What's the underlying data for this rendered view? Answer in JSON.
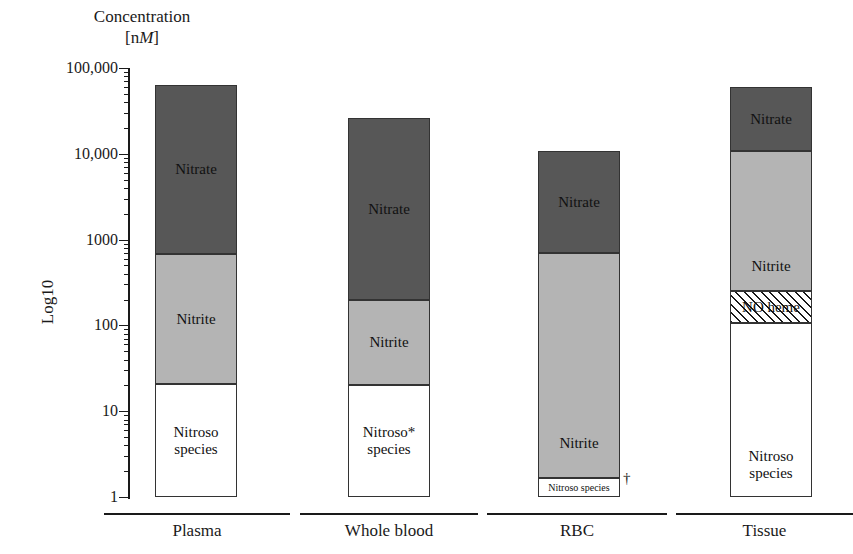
{
  "title": {
    "line1": "Concentration",
    "line2_prefix": "[n",
    "line2_italic": "M",
    "line2_suffix": "]"
  },
  "axis": {
    "y_label": "Log10",
    "y_ticks": [
      "100,000",
      "10,000",
      "1000",
      "100",
      "10",
      "1"
    ]
  },
  "colors": {
    "nitrate": "#575757",
    "nitrite": "#b4b4b4",
    "nitroso": "#ffffff",
    "no_heme": "#ffffff",
    "axis": "#1a1a1a"
  },
  "markers": {
    "rbc_dagger": "†"
  },
  "labels": {
    "nitrate": "Nitrate",
    "nitrite": "Nitrite",
    "nitroso_line1": "Nitroso",
    "nitroso_star_line1": "Nitroso*",
    "nitroso_line2": "species",
    "nitroso_inline": "Nitroso species",
    "no_heme": "NO heme"
  },
  "chart_data": {
    "type": "bar",
    "title": "Concentration [nM]",
    "xlabel": "",
    "ylabel": "Log10",
    "yscale": "log10",
    "ylim": [
      1,
      100000
    ],
    "ytick_values": [
      1,
      10,
      100,
      1000,
      10000,
      100000
    ],
    "ytick_labels": [
      "1",
      "10",
      "100",
      "1000",
      "10,000",
      "100,000"
    ],
    "grid": false,
    "legend": "in-bar labels",
    "stacked": true,
    "categories": [
      "Plasma",
      "Whole blood",
      "RBC",
      "Tissue"
    ],
    "series": [
      {
        "name": "Nitrate",
        "fill": "dark-gray",
        "top_values": [
          63000,
          23000,
          10500,
          60000
        ],
        "bottom_values": [
          650,
          190,
          660,
          10000
        ]
      },
      {
        "name": "Nitrite",
        "fill": "medium-gray",
        "top_values": [
          650,
          190,
          660,
          10000
        ],
        "bottom_values": [
          20,
          20,
          1.3,
          270
        ]
      },
      {
        "name": "NO heme",
        "fill": "hatched",
        "top_values": [
          null,
          null,
          null,
          270
        ],
        "bottom_values": [
          null,
          null,
          null,
          140
        ]
      },
      {
        "name": "Nitroso species",
        "fill": "white",
        "top_values": [
          20,
          20,
          1.3,
          140
        ],
        "bottom_values": [
          1,
          1,
          1,
          1
        ]
      }
    ],
    "annotations": [
      "Whole blood nitroso species marked with asterisk (*)",
      "RBC nitroso species marked with dagger (†)"
    ]
  },
  "groups": [
    {
      "name": "Plasma",
      "label": "Plasma",
      "segments": [
        {
          "key": "nitrate",
          "label": "Nitrate",
          "label2": ""
        },
        {
          "key": "nitrite",
          "label": "Nitrite",
          "label2": ""
        },
        {
          "key": "nitroso",
          "label": "Nitroso",
          "label2": "species"
        }
      ]
    },
    {
      "name": "Whole blood",
      "label": "Whole blood",
      "segments": [
        {
          "key": "nitrate",
          "label": "Nitrate",
          "label2": ""
        },
        {
          "key": "nitrite",
          "label": "Nitrite",
          "label2": ""
        },
        {
          "key": "nitroso",
          "label": "Nitroso*",
          "label2": "species"
        }
      ]
    },
    {
      "name": "RBC",
      "label": "RBC",
      "segments": [
        {
          "key": "nitrate",
          "label": "Nitrate",
          "label2": ""
        },
        {
          "key": "nitrite",
          "label": "Nitrite",
          "label2": ""
        },
        {
          "key": "nitroso",
          "label": "Nitroso species",
          "label2": ""
        }
      ]
    },
    {
      "name": "Tissue",
      "label": "Tissue",
      "segments": [
        {
          "key": "nitrate",
          "label": "Nitrate",
          "label2": ""
        },
        {
          "key": "nitrite",
          "label": "Nitrite",
          "label2": ""
        },
        {
          "key": "no_heme",
          "label": "NO heme",
          "label2": ""
        },
        {
          "key": "nitroso",
          "label": "Nitroso",
          "label2": "species"
        }
      ]
    }
  ]
}
